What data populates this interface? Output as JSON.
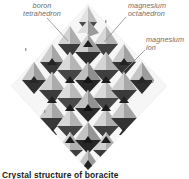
{
  "figure": {
    "title": "Crystal structure of boracite",
    "caption": "Crystal structure of boracite",
    "background_color": "#ffffff"
  },
  "labels": {
    "boron_tetrahedron": "boron\ntetrahedron",
    "magnesium_octahedron": "magnesium\noctahedron",
    "magnesium_ion": "magnesium\nion"
  },
  "diagram": {
    "rendering": "grayscale polyhedral ball-and-stick lattice",
    "silhouette": "diamond / rhombus",
    "label_color": "#6e6e6e",
    "caption_color": "#1a1a1a",
    "palette": {
      "highlight": "#f2f2f2",
      "light": "#dcdcdc",
      "mid": "#a8a8a8",
      "shadow": "#6b6b6b",
      "dark": "#3a3a3a",
      "darkest": "#1f1f1f",
      "leader_line": "#8c8c8c"
    }
  }
}
